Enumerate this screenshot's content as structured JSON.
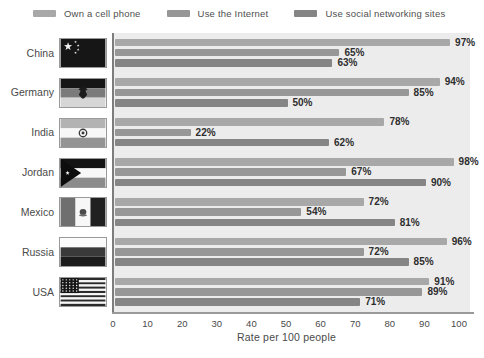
{
  "legend": [
    {
      "label": "Own a cell phone",
      "color": "#a8a8a8"
    },
    {
      "label": "Use the Internet",
      "color": "#979797"
    },
    {
      "label": "Use social networking sites",
      "color": "#858585"
    }
  ],
  "chart_data": {
    "type": "bar",
    "orientation": "horizontal",
    "title": "",
    "categories": [
      "China",
      "Germany",
      "India",
      "Jordan",
      "Mexico",
      "Russia",
      "USA"
    ],
    "series": [
      {
        "name": "Own a cell phone",
        "color": "#a8a8a8",
        "values": [
          97,
          94,
          78,
          98,
          72,
          96,
          91
        ]
      },
      {
        "name": "Use the Internet",
        "color": "#979797",
        "values": [
          65,
          85,
          22,
          67,
          54,
          72,
          89
        ]
      },
      {
        "name": "Use social networking sites",
        "color": "#858585",
        "values": [
          63,
          50,
          62,
          90,
          81,
          85,
          71
        ]
      }
    ],
    "value_suffix": "%",
    "xlabel": "Rate per 100 people",
    "xlim": [
      0,
      100
    ],
    "xticks": [
      0,
      10,
      20,
      30,
      40,
      50,
      60,
      70,
      80,
      90,
      100
    ],
    "plot_background": "#ececec",
    "legend_position": "top",
    "grid": false
  }
}
